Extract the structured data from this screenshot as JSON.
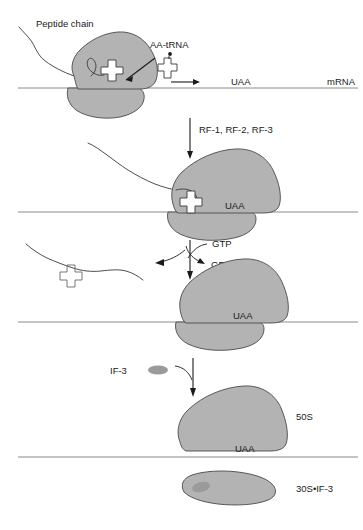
{
  "figure": {
    "colors": {
      "subunit_fill": "#b3b3b3",
      "subunit_stroke": "#4a4a4a",
      "mrna_line": "#8a8a8a",
      "text": "#1a1a1a",
      "if3_blob": "#9a9a9a"
    }
  },
  "labels": {
    "peptide_chain": "Peptide chain",
    "aa_trna": "AA-tRNA",
    "mrna": "mRNA",
    "release_factors": "RF-1, RF-2, RF-3",
    "gtp": "GTP",
    "gdp_pi": "GDP + P",
    "gdp_pi_subscript": "i",
    "if3": "IF-3",
    "large_subunit": "50S",
    "small_subunit_if3": "30S•IF-3"
  },
  "stop_codons": {
    "panel1": "UAA",
    "panel2": "UAA",
    "panel3": "UAA",
    "panel4": "UAA"
  },
  "panels": [
    {
      "id": "panel-1",
      "name": "elongation-complex",
      "description": "70S ribosome with peptidyl-tRNA and incoming AA-tRNA approaching stop codon",
      "codon": "UAA",
      "has_peptide_chain": true,
      "has_charged_trna": true
    },
    {
      "id": "panel-2",
      "name": "release-factor-binding",
      "description": "Release factors bind the stop codon in the A site",
      "codon": "UAA",
      "has_peptide_chain": true,
      "has_charged_trna": false
    },
    {
      "id": "panel-3",
      "name": "peptide-release",
      "description": "GTP hydrolysis releases the polypeptide and uncharged tRNA",
      "codon": "UAA",
      "has_peptide_chain": false,
      "has_charged_trna": false
    },
    {
      "id": "panel-4",
      "name": "subunit-dissociation",
      "description": "IF-3 binds the 30S subunit and the ribosome dissociates",
      "codon": "UAA",
      "large_subunit": "50S",
      "small_subunit": "30S•IF-3"
    }
  ],
  "steps": [
    {
      "name": "step-arrow-1",
      "label": ""
    },
    {
      "name": "step-arrow-2",
      "label": "RF-1, RF-2, RF-3"
    },
    {
      "name": "step-arrow-3",
      "label": "GTP"
    },
    {
      "name": "step-arrow-4",
      "label": "IF-3"
    }
  ]
}
